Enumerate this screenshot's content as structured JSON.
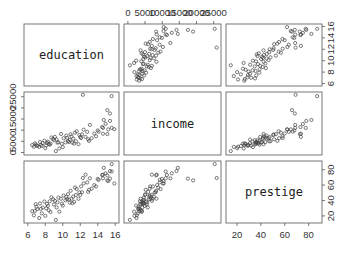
{
  "chart_data": {
    "type": "scatter",
    "subtype": "scatterplot-matrix",
    "variables": [
      "education",
      "income",
      "prestige"
    ],
    "diagonal_labels": [
      "education",
      "income",
      "prestige"
    ],
    "axes": {
      "education": {
        "range": [
          6,
          16
        ],
        "ticks": [
          6,
          8,
          10,
          12,
          14,
          16
        ],
        "tick_labels": [
          "6",
          "8",
          "10",
          "12",
          "14",
          "16"
        ],
        "axis_positions": [
          "bottom",
          "right"
        ]
      },
      "income": {
        "range": [
          0,
          26000
        ],
        "ticks": [
          0,
          5000,
          10000,
          15000,
          20000,
          25000
        ],
        "tick_labels": [
          "0",
          "5000",
          "10000",
          "15000",
          "20000",
          "25000"
        ],
        "top_tick_labels": [
          "0",
          "5000",
          "10000",
          "15000",
          "20000",
          "25000"
        ],
        "left_tick_labels": [
          "0",
          "5000",
          "15000",
          "25000"
        ],
        "axis_positions": [
          "top",
          "left"
        ]
      },
      "prestige": {
        "range": [
          14,
          88
        ],
        "ticks": [
          20,
          40,
          60,
          80
        ],
        "tick_labels": [
          "20",
          "40",
          "60",
          "80"
        ],
        "axis_positions": [
          "bottom",
          "right"
        ]
      }
    },
    "grid": false,
    "legend": null,
    "points": [
      {
        "education": 13.1,
        "income": 12351,
        "prestige": 68.8
      },
      {
        "education": 12.3,
        "income": 25879,
        "prestige": 69.1
      },
      {
        "education": 12.8,
        "income": 9271,
        "prestige": 63.4
      },
      {
        "education": 11.4,
        "income": 8865,
        "prestige": 56.8
      },
      {
        "education": 14.6,
        "income": 8403,
        "prestige": 73.5
      },
      {
        "education": 15.6,
        "income": 11030,
        "prestige": 77.6
      },
      {
        "education": 15.1,
        "income": 8258,
        "prestige": 72.6
      },
      {
        "education": 15.4,
        "income": 14163,
        "prestige": 78.1
      },
      {
        "education": 14.5,
        "income": 11377,
        "prestige": 73.1
      },
      {
        "education": 14.6,
        "income": 11023,
        "prestige": 68.8
      },
      {
        "education": 15.6,
        "income": 25308,
        "prestige": 87.2
      },
      {
        "education": 15.1,
        "income": 19000,
        "prestige": 66.1
      },
      {
        "education": 15.4,
        "income": 17498,
        "prestige": 68.4
      },
      {
        "education": 15.9,
        "income": 10432,
        "prestige": 62.0
      },
      {
        "education": 14.7,
        "income": 14558,
        "prestige": 82.3
      },
      {
        "education": 15.2,
        "income": 10374,
        "prestige": 65.1
      },
      {
        "education": 12.6,
        "income": 6986,
        "prestige": 73.5
      },
      {
        "education": 12.2,
        "income": 8104,
        "prestige": 50.7
      },
      {
        "education": 12.1,
        "income": 6500,
        "prestige": 58.3
      },
      {
        "education": 11.2,
        "income": 6200,
        "prestige": 45.0
      },
      {
        "education": 11.5,
        "income": 5000,
        "prestige": 47.1
      },
      {
        "education": 10.7,
        "income": 4700,
        "prestige": 41.0
      },
      {
        "education": 10.6,
        "income": 5100,
        "prestige": 48.1
      },
      {
        "education": 11.0,
        "income": 7200,
        "prestige": 42.5
      },
      {
        "education": 9.9,
        "income": 3900,
        "prestige": 35.9
      },
      {
        "education": 9.4,
        "income": 4400,
        "prestige": 37.6
      },
      {
        "education": 8.9,
        "income": 6100,
        "prestige": 41.5
      },
      {
        "education": 8.5,
        "income": 3500,
        "prestige": 38.9
      },
      {
        "education": 8.1,
        "income": 3200,
        "prestige": 29.7
      },
      {
        "education": 7.6,
        "income": 2900,
        "prestige": 23.3
      },
      {
        "education": 7.1,
        "income": 3000,
        "prestige": 28.8
      },
      {
        "education": 6.8,
        "income": 4100,
        "prestige": 26.5
      },
      {
        "education": 6.9,
        "income": 3600,
        "prestige": 35.2
      },
      {
        "education": 7.4,
        "income": 4700,
        "prestige": 36.1
      },
      {
        "education": 7.9,
        "income": 5300,
        "prestige": 38.7
      },
      {
        "education": 8.3,
        "income": 4900,
        "prestige": 33.0
      },
      {
        "education": 8.7,
        "income": 6700,
        "prestige": 44.1
      },
      {
        "education": 9.1,
        "income": 7000,
        "prestige": 39.4
      },
      {
        "education": 9.8,
        "income": 8300,
        "prestige": 42.3
      },
      {
        "education": 10.1,
        "income": 6400,
        "prestige": 46.5
      },
      {
        "education": 10.4,
        "income": 7600,
        "prestige": 44.8
      },
      {
        "education": 10.9,
        "income": 8200,
        "prestige": 52.6
      },
      {
        "education": 11.3,
        "income": 4000,
        "prestige": 38.3
      },
      {
        "education": 9.6,
        "income": 1800,
        "prestige": 25.5
      },
      {
        "education": 8.0,
        "income": 1900,
        "prestige": 20.1
      },
      {
        "education": 7.3,
        "income": 2500,
        "prestige": 17.3
      },
      {
        "education": 9.2,
        "income": 600,
        "prestige": 14.8
      },
      {
        "education": 10.0,
        "income": 2400,
        "prestige": 33.3
      },
      {
        "education": 11.8,
        "income": 3700,
        "prestige": 42.2
      },
      {
        "education": 12.9,
        "income": 5900,
        "prestige": 51.1
      },
      {
        "education": 13.6,
        "income": 8500,
        "prestige": 60.0
      },
      {
        "education": 14.1,
        "income": 9300,
        "prestige": 66.7
      },
      {
        "education": 13.8,
        "income": 7300,
        "prestige": 58.1
      },
      {
        "education": 6.5,
        "income": 3300,
        "prestige": 26.1
      },
      {
        "education": 7.7,
        "income": 4200,
        "prestige": 30.9
      },
      {
        "education": 8.4,
        "income": 3800,
        "prestige": 27.3
      },
      {
        "education": 9.0,
        "income": 5500,
        "prestige": 34.8
      },
      {
        "education": 10.3,
        "income": 4500,
        "prestige": 40.2
      },
      {
        "education": 11.6,
        "income": 9500,
        "prestige": 54.9
      },
      {
        "education": 12.4,
        "income": 10200,
        "prestige": 62.2
      },
      {
        "education": 13.3,
        "income": 6400,
        "prestige": 55.3
      },
      {
        "education": 6.7,
        "income": 2600,
        "prestige": 20.8
      },
      {
        "education": 7.0,
        "income": 3100,
        "prestige": 31.8
      },
      {
        "education": 8.6,
        "income": 4000,
        "prestige": 25.0
      },
      {
        "education": 9.5,
        "income": 4600,
        "prestige": 43.7
      },
      {
        "education": 10.8,
        "income": 5600,
        "prestige": 37.2
      },
      {
        "education": 11.9,
        "income": 7800,
        "prestige": 50.3
      },
      {
        "education": 12.0,
        "income": 6900,
        "prestige": 47.3
      },
      {
        "education": 13.0,
        "income": 5200,
        "prestige": 53.8
      },
      {
        "education": 14.0,
        "income": 9900,
        "prestige": 68.0
      },
      {
        "education": 14.9,
        "income": 12800,
        "prestige": 75.2
      },
      {
        "education": 7.5,
        "income": 3400,
        "prestige": 29.1
      },
      {
        "education": 8.2,
        "income": 4300,
        "prestige": 35.6
      },
      {
        "education": 9.3,
        "income": 5800,
        "prestige": 31.0
      },
      {
        "education": 10.5,
        "income": 6600,
        "prestige": 41.8
      },
      {
        "education": 11.1,
        "income": 4400,
        "prestige": 36.5
      }
    ]
  }
}
